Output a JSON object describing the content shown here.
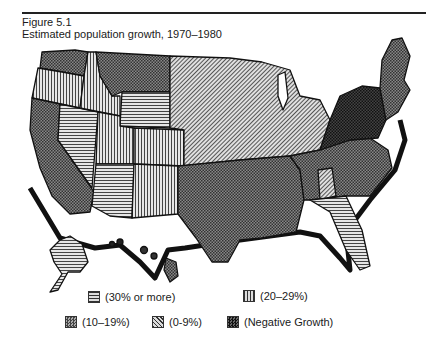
{
  "figure": {
    "label": "Figure 5.1",
    "title": "Estimated population growth, 1970–1980"
  },
  "legend": [
    {
      "key": "30plus",
      "label": "(30% or more)",
      "pattern": "horizontal-lines"
    },
    {
      "key": "20to29",
      "label": "(20–29%)",
      "pattern": "vertical-lines"
    },
    {
      "key": "10to19",
      "label": "(10–19%)",
      "pattern": "dark-dots"
    },
    {
      "key": "0to9",
      "label": "(0-9%)",
      "pattern": "diagonal-lines"
    },
    {
      "key": "negative",
      "label": "(Negative Growth)",
      "pattern": "black-dots"
    }
  ],
  "map": {
    "regions": [
      {
        "name": "Pacific Northwest (WA)",
        "category": "10to19"
      },
      {
        "name": "Oregon",
        "category": "20to29"
      },
      {
        "name": "California",
        "category": "10to19"
      },
      {
        "name": "Nevada",
        "category": "30plus"
      },
      {
        "name": "Idaho",
        "category": "20to29"
      },
      {
        "name": "Montana",
        "category": "10to19"
      },
      {
        "name": "Wyoming",
        "category": "30plus"
      },
      {
        "name": "Utah",
        "category": "20to29"
      },
      {
        "name": "Colorado",
        "category": "20to29"
      },
      {
        "name": "Arizona",
        "category": "30plus"
      },
      {
        "name": "New Mexico",
        "category": "20to29"
      },
      {
        "name": "Plains & Midwest",
        "category": "0to9"
      },
      {
        "name": "Texas / South Central",
        "category": "10to19"
      },
      {
        "name": "Southeast",
        "category": "10to19"
      },
      {
        "name": "Alabama",
        "category": "0to9"
      },
      {
        "name": "Florida",
        "category": "30plus"
      },
      {
        "name": "Northeast (NY/PA)",
        "category": "negative"
      },
      {
        "name": "Maine / New England",
        "category": "10to19"
      },
      {
        "name": "Alaska",
        "category": "30plus"
      },
      {
        "name": "Hawaii",
        "category": "10to19"
      }
    ]
  }
}
